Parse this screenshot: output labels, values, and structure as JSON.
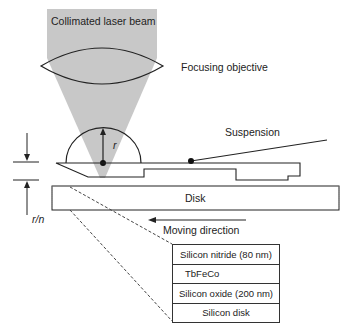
{
  "labels": {
    "laser_beam": "Collimated laser beam",
    "objective": "Focusing objective",
    "suspension": "Suspension",
    "disk": "Disk",
    "moving_direction": "Moving direction",
    "radius": "r",
    "gap": "r/n"
  },
  "layers": [
    {
      "name": "Silicon nitride (80 nm)"
    },
    {
      "name": "TbFeCo"
    },
    {
      "name": "Silicon oxide (200 nm)"
    },
    {
      "name": "Silicon disk"
    }
  ],
  "colors": {
    "beam": "#c8c8c8",
    "line": "#222222"
  }
}
